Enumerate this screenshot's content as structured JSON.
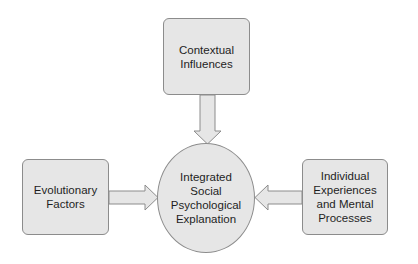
{
  "diagram": {
    "type": "flow-convergence",
    "colors": {
      "node_fill": "#e6e6e6",
      "node_border": "#8c8c8c",
      "text": "#1e1e1e",
      "background": "#ffffff"
    },
    "nodes": {
      "top": {
        "lines": [
          "Contextual",
          "Influences"
        ]
      },
      "left": {
        "lines": [
          "Evolutionary",
          "Factors"
        ]
      },
      "right": {
        "lines": [
          "Individual",
          "Experiences",
          "and Mental",
          "Processes"
        ]
      },
      "center": {
        "lines": [
          "Integrated",
          "Social",
          "Psychological",
          "Explanation"
        ]
      }
    },
    "edges": [
      {
        "from": "Contextual Influences",
        "to": "Integrated Social Psychological Explanation",
        "direction": "down"
      },
      {
        "from": "Evolutionary Factors",
        "to": "Integrated Social Psychological Explanation",
        "direction": "right"
      },
      {
        "from": "Individual Experiences and Mental Processes",
        "to": "Integrated Social Psychological Explanation",
        "direction": "left"
      }
    ]
  }
}
